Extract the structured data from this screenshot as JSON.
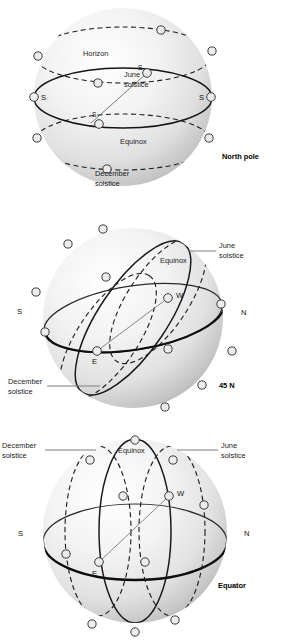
{
  "figure": {
    "colors": {
      "sphere_light": "#fdfdfd",
      "sphere_mid": "#e6e6e6",
      "sphere_shadow": "#b9b9b9",
      "line": "#1a1a1a",
      "leader": "#8a8a8a",
      "marker_fill": "#e8e8e8",
      "background": "#ffffff"
    }
  },
  "panels": [
    {
      "id": "north-pole",
      "caption": "North pole",
      "labels": {
        "horizon": "Horizon",
        "june_solstice_line1": "June",
        "june_solstice_line2": "solstice",
        "equinox": "Equinox",
        "december_solstice_line1": "December",
        "december_solstice_line2": "solstice"
      },
      "directions": {
        "left": "S",
        "right": "S",
        "inner_upper": "S",
        "inner_lower": "S"
      }
    },
    {
      "id": "45n",
      "caption": "45 N",
      "labels": {
        "june_solstice_line1": "June",
        "june_solstice_line2": "solstice",
        "equinox": "Equinox",
        "december_solstice_line1": "December",
        "december_solstice_line2": "solstice"
      },
      "directions": {
        "south": "S",
        "north": "N",
        "west": "W",
        "east": "E"
      }
    },
    {
      "id": "equator",
      "caption": "Equator",
      "labels": {
        "june_solstice_line1": "June",
        "june_solstice_line2": "solstice",
        "equinox": "Equinox",
        "december_solstice_line1": "December",
        "december_solstice_line2": "solstice"
      },
      "directions": {
        "south": "S",
        "north": "N",
        "west": "W",
        "east": "E"
      }
    }
  ]
}
